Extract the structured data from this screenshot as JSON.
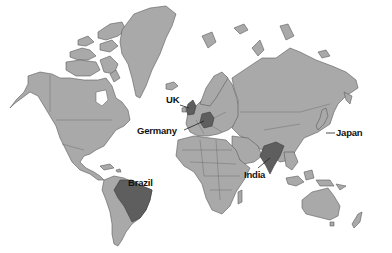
{
  "map": {
    "type": "world-map",
    "style": "grayscale",
    "colors": {
      "background": "#ffffff",
      "land": "#a9a9a9",
      "highlight": "#5e5e5e",
      "border": "#5a5a5a",
      "label": "#111111"
    },
    "highlighted_countries": [
      {
        "name": "UK",
        "label": "UK"
      },
      {
        "name": "Germany",
        "label": "Germany"
      },
      {
        "name": "Brazil",
        "label": "Brazil"
      },
      {
        "name": "India",
        "label": "India"
      },
      {
        "name": "Japan",
        "label": "Japan"
      }
    ]
  }
}
